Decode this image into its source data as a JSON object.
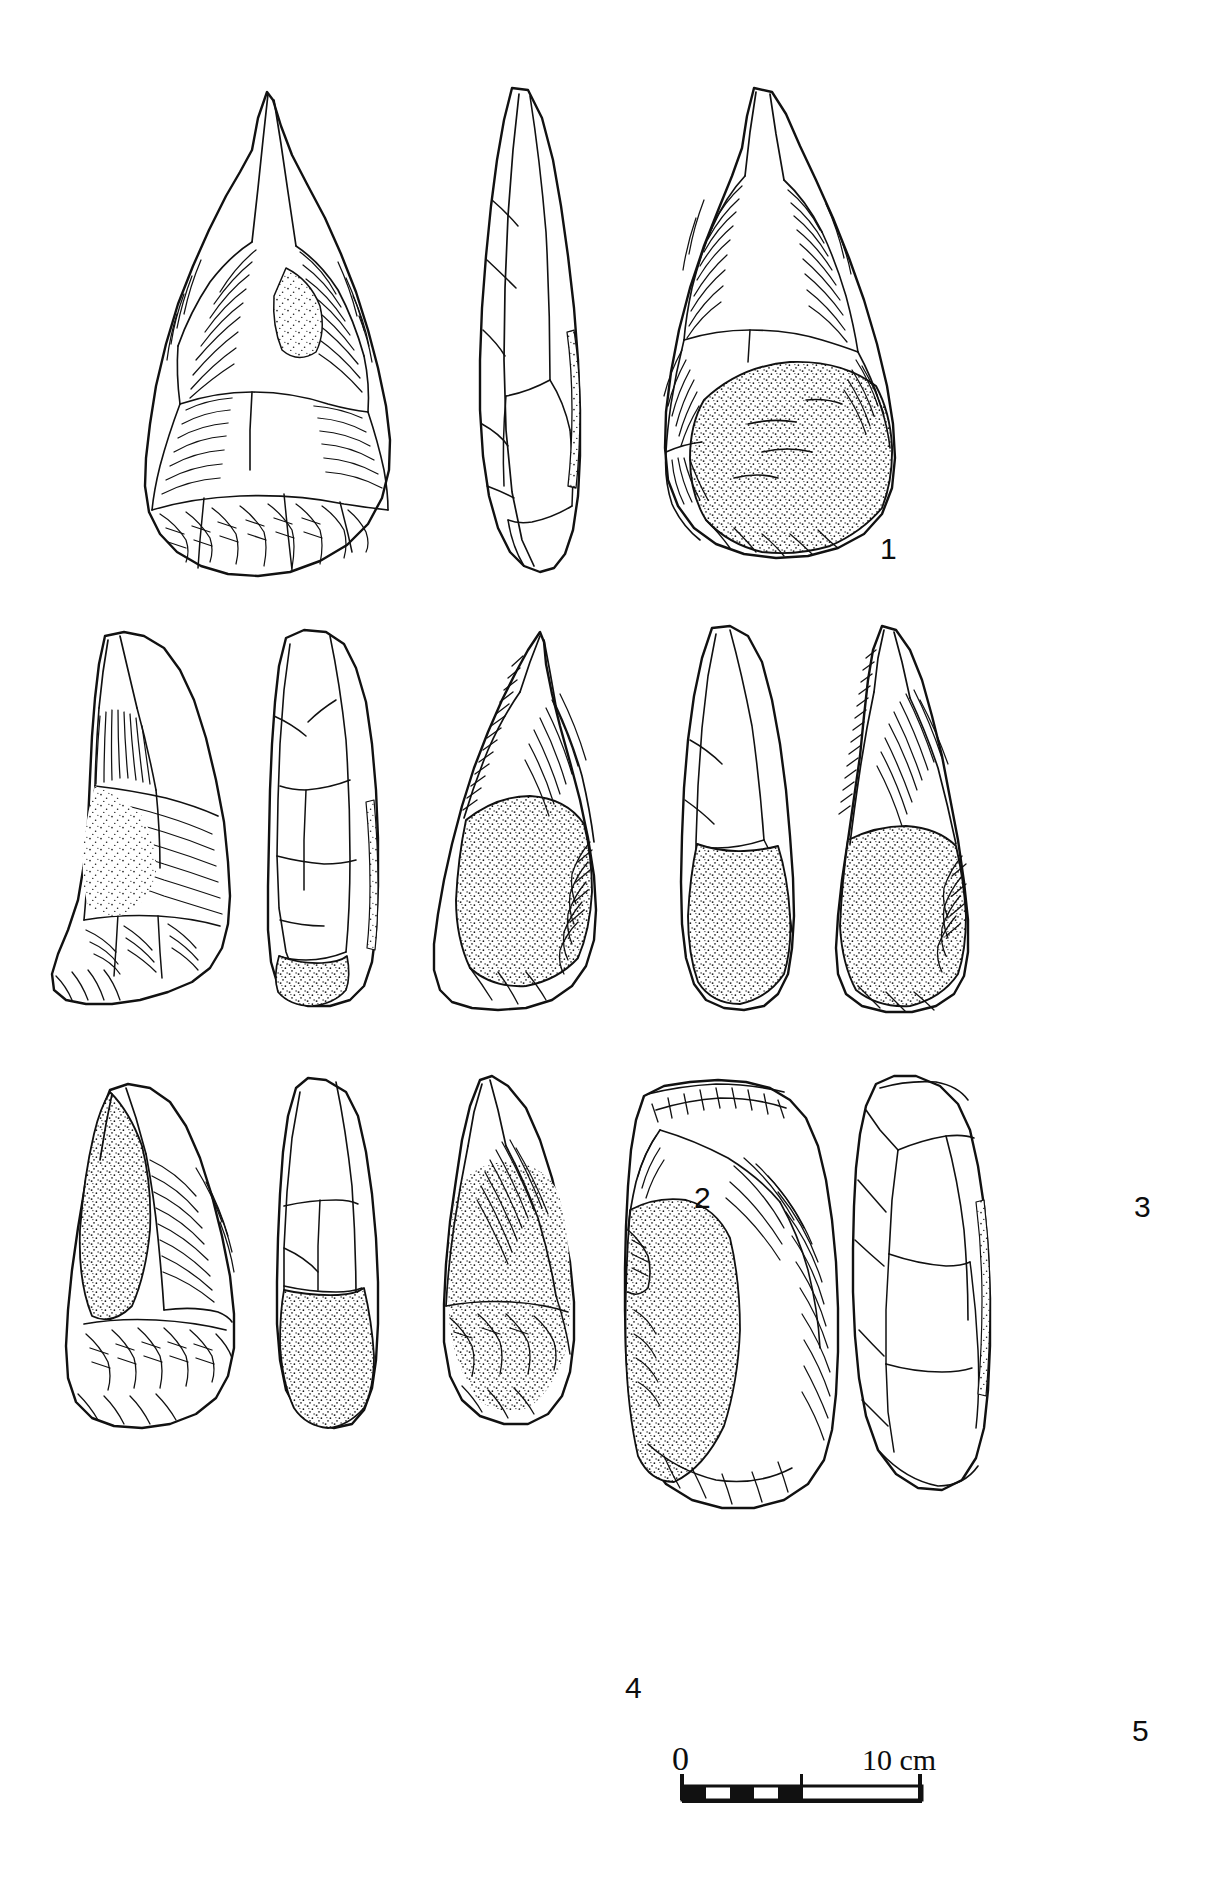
{
  "plate": {
    "kind": "archaeological-lithic-illustration-plate",
    "background_color": "#ffffff",
    "ink_color": "#111111",
    "width": 1225,
    "height": 1883
  },
  "artifacts": [
    {
      "number": "1",
      "label": "1",
      "description": "Large pointed biface / handaxe, three views: dorsal face, lateral profile, ventral face with cortex",
      "views": [
        "dorsal",
        "profile",
        "ventral"
      ],
      "cortex_present": true,
      "label_position": {
        "x": 880,
        "y": 534
      }
    },
    {
      "number": "2",
      "label": "2",
      "description": "Elongated pointed biface, three views: dorsal face, lateral profile, ventral face with cortex at base",
      "views": [
        "dorsal",
        "profile",
        "ventral"
      ],
      "cortex_present": true,
      "label_position": {
        "x": 694,
        "y": 1183
      }
    },
    {
      "number": "3",
      "label": "3",
      "description": "Narrow elongated point, two views: lateral profile and flaked face with cortex base",
      "views": [
        "profile",
        "face"
      ],
      "cortex_present": true,
      "label_position": {
        "x": 1134,
        "y": 1192
      }
    },
    {
      "number": "4",
      "label": "4",
      "description": "Triangular flake tool, three views: dorsal face with cortex, lateral profile, ventral face",
      "views": [
        "dorsal",
        "profile",
        "ventral"
      ],
      "cortex_present": true,
      "label_position": {
        "x": 625,
        "y": 1673
      }
    },
    {
      "number": "5",
      "label": "5",
      "description": "Broad blunt-ended flake tool, two views: dorsal face with cortex and lateral profile",
      "views": [
        "dorsal",
        "profile"
      ],
      "cortex_present": true,
      "label_position": {
        "x": 1132,
        "y": 1716
      }
    }
  ],
  "scale_bar": {
    "zero_label": "0",
    "max_label": "10 cm",
    "total_length_cm": 10,
    "segments": 10,
    "segmented_half": "left",
    "style": "alternating black and white blocks on left half, open outline on right half"
  },
  "icon_names": {
    "scale_bar": "scale-bar-icon",
    "artifact": "lithic-artifact-drawing"
  }
}
